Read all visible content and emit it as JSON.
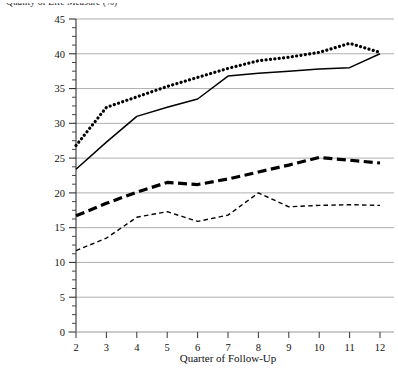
{
  "chart_data": {
    "type": "line",
    "title": "Quality of Life Measure (%)",
    "xlabel": "Quarter of Follow-Up",
    "ylabel": "",
    "grid": true,
    "legend": "none",
    "x": [
      2,
      3,
      4,
      5,
      6,
      7,
      8,
      9,
      10,
      11,
      12
    ],
    "xtick_labels": [
      "2",
      "3",
      "4",
      "5",
      "6",
      "7",
      "8",
      "9",
      "10",
      "11",
      "12"
    ],
    "xlim": [
      2,
      12
    ],
    "ylim": [
      0,
      45
    ],
    "ytick_labels": [
      "0",
      "5",
      "10",
      "15",
      "20",
      "25",
      "30",
      "35",
      "40",
      "45"
    ],
    "yticks": [
      0,
      5,
      10,
      15,
      20,
      25,
      30,
      35,
      40,
      45
    ],
    "y_minor_tick_step": 1.25,
    "series": [
      {
        "name": "series-dotted-top",
        "style": "dotted",
        "color": "#000000",
        "width": 3.2,
        "values": [
          26.8,
          32.3,
          33.8,
          35.3,
          36.6,
          37.9,
          39.0,
          39.5,
          40.2,
          41.5,
          40.2
        ]
      },
      {
        "name": "series-solid",
        "style": "solid",
        "color": "#000000",
        "width": 1.5,
        "values": [
          23.4,
          27.3,
          31.0,
          32.3,
          33.5,
          36.8,
          37.2,
          37.5,
          37.8,
          38.0,
          40.0
        ]
      },
      {
        "name": "series-dashed-thick",
        "style": "dashed-thick",
        "color": "#000000",
        "width": 3.2,
        "values": [
          16.7,
          18.5,
          20.1,
          21.5,
          21.2,
          22.0,
          23.0,
          24.0,
          25.1,
          24.7,
          24.3
        ]
      },
      {
        "name": "series-dashed-thin",
        "style": "dashed-thin",
        "color": "#000000",
        "width": 1.4,
        "values": [
          11.7,
          13.5,
          16.5,
          17.3,
          15.9,
          16.8,
          20.0,
          18.0,
          18.2,
          18.3,
          18.2
        ]
      }
    ],
    "colors": {
      "axis": "#333333",
      "grid": "#9a9a9a",
      "plot_background": "#ffffff",
      "ink": "#000000"
    }
  }
}
